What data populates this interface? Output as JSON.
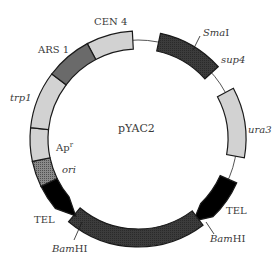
{
  "plasmid": {
    "name": "pYAC2",
    "colors": {
      "background": "#ffffff",
      "outline": "#1a1a1a",
      "light_segment": "#d2d2d2",
      "medium_segment": "#6a6a6a",
      "dark_segment": "#3a3a3a",
      "ori_segment": "#7a7a7a",
      "telomere": "#000000",
      "backbone_line": "#555555"
    },
    "segments": [
      {
        "id": "cen4",
        "label": "CEN 4",
        "italic": false
      },
      {
        "id": "sup4",
        "label": "sup4",
        "italic": true
      },
      {
        "id": "ura3",
        "label": "ura3",
        "italic": true
      },
      {
        "id": "tel-right",
        "label": "TEL",
        "italic": false
      },
      {
        "id": "bamhi-stuffer",
        "label": "",
        "italic": false
      },
      {
        "id": "tel-left",
        "label": "TEL",
        "italic": false
      },
      {
        "id": "ori",
        "label": "ori",
        "italic": true
      },
      {
        "id": "apr",
        "label": "Ap",
        "superscript": "r",
        "italic": false
      },
      {
        "id": "trp1",
        "label": "trp1",
        "italic": true
      },
      {
        "id": "ars1",
        "label": "ARS 1",
        "italic": false
      }
    ],
    "sites": [
      {
        "id": "smai",
        "label_italic": "Sma",
        "label_plain": "I"
      },
      {
        "id": "bamhi-right",
        "label_italic": "Bam",
        "label_plain": "HI"
      },
      {
        "id": "bamhi-left",
        "label_italic": "Bam",
        "label_plain": "HI"
      }
    ]
  }
}
